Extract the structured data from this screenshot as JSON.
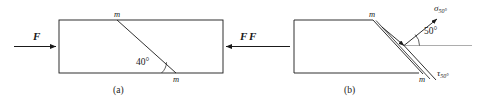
{
  "figure": {
    "caption_a": "(a)",
    "caption_b": "(b)",
    "panel_a": {
      "force_left_label": "F",
      "force_right_label": "F",
      "section_label_top": "m",
      "section_label_bottom": "m",
      "angle_label": "40°",
      "angle_value": 40,
      "shape": "rectangle",
      "description": "Prismatic bar in axial tension with inclined section plane m-m"
    },
    "panel_b": {
      "force_left_label": "F",
      "section_label_top": "m",
      "section_label_bottom": "m",
      "angle_label": "50°",
      "angle_value": 50,
      "normal_stress_symbol": "σ",
      "normal_stress_subscript": "50°",
      "shear_stress_symbol": "τ",
      "shear_stress_subscript": "50°",
      "description": "Free body of left portion showing normal stress and shear stress on inclined plane"
    },
    "colors": {
      "stroke": "#1a1a1a",
      "text": "#1a1a1a",
      "background": "#ffffff"
    }
  }
}
